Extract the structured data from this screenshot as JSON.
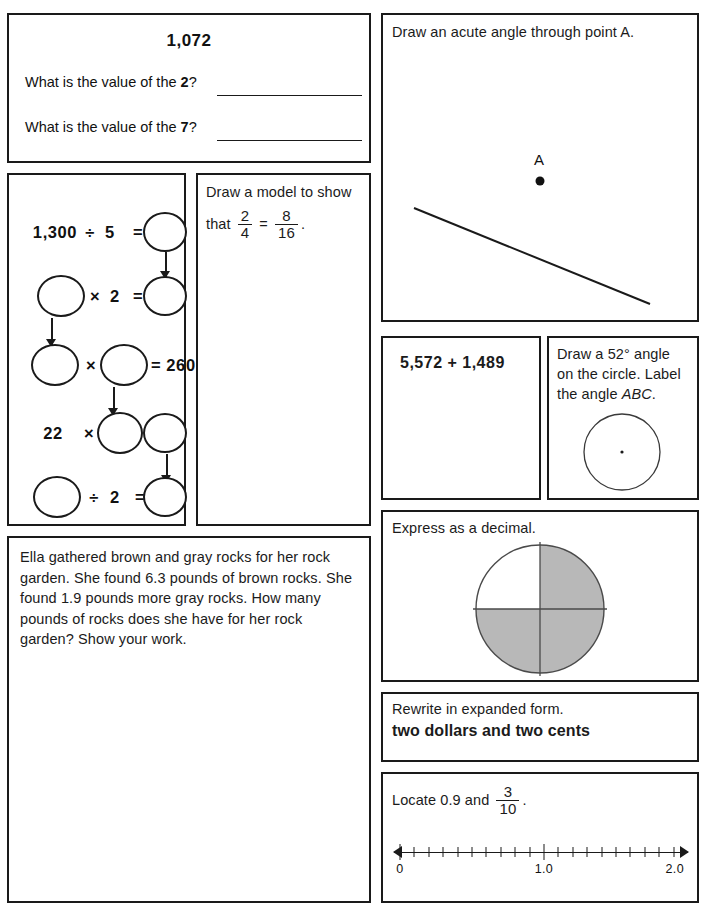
{
  "worksheet": {
    "title": "Daily Math Practice Worksheet",
    "ink_color": "#1a1a1a",
    "shade_color": "#b8b8b8"
  },
  "place_value": {
    "number": "1,072",
    "question_1_prefix": "What is the value of the ",
    "question_1_digit": "2",
    "question_1_suffix": "?",
    "question_2_prefix": "What is the value of the ",
    "question_2_digit": "7",
    "question_2_suffix": "?"
  },
  "flow_chart": {
    "rows": [
      {
        "left": "1,300",
        "op": "÷",
        "mid": "5",
        "eq": "=",
        "right": ""
      },
      {
        "left": "",
        "op": "×",
        "mid": "2",
        "eq": "=",
        "right": ""
      },
      {
        "left": "",
        "op": "×",
        "mid": "",
        "eq": "=",
        "right": "260"
      },
      {
        "left": "22",
        "op": "×",
        "mid": "",
        "eq": "=",
        "right": ""
      },
      {
        "left": "",
        "op": "÷",
        "mid": "2",
        "eq": "=",
        "right": ""
      }
    ],
    "known_values": [
      "1,300",
      "5",
      "2",
      "260",
      "22",
      "2"
    ]
  },
  "fraction_model": {
    "line_1": "Draw a model to show",
    "line_2_prefix": "that",
    "fraction_a_num": "2",
    "fraction_a_den": "4",
    "equals": "=",
    "fraction_b_num": "8",
    "fraction_b_den": "16",
    "period": "."
  },
  "acute_angle": {
    "prompt": "Draw an acute angle through point A.",
    "point_label": "A"
  },
  "addition": {
    "expression": "5,572 + 1,489"
  },
  "circle_angle": {
    "line_1": "Draw a 52° angle",
    "line_2": "on the circle. Label",
    "line_3_prefix": "the angle ",
    "line_3_italic": "ABC",
    "line_3_suffix": "."
  },
  "decimal_pie": {
    "prompt": "Express as a decimal.",
    "total_parts": 4,
    "shaded_parts": 3,
    "shaded_quadrants": [
      "top-right",
      "bottom-right",
      "bottom-left"
    ],
    "fraction_shown": "3/4"
  },
  "word_problem": {
    "text": "Ella gathered brown and gray rocks for her rock garden. She found 6.3 pounds of brown rocks. She found 1.9 pounds more gray rocks. How many pounds of rocks does she have for her rock garden? Show your work."
  },
  "expanded_form": {
    "prompt": "Rewrite in expanded form.",
    "value": "two dollars and two cents"
  },
  "number_line": {
    "prompt_prefix": "Locate 0.9 and",
    "fraction_num": "3",
    "fraction_den": "10",
    "period": ".",
    "labels": [
      "0",
      "1.0",
      "2.0"
    ],
    "label_positions": [
      0,
      1.0,
      2.0
    ],
    "range_min": 0,
    "range_max": 2.0,
    "minor_tick_count": 20
  }
}
